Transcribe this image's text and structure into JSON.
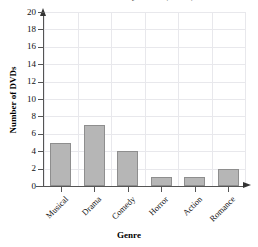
{
  "chart_data": {
    "type": "bar",
    "title": "DVD Collection by Genre (DVDs)",
    "title_cropped": true,
    "categories": [
      "Musical",
      "Drama",
      "Comedy",
      "Horror",
      "Action",
      "Romance"
    ],
    "values": [
      5,
      7,
      4,
      1,
      1,
      2
    ],
    "xlabel": "Genre",
    "ylabel": "Number of DVDs",
    "ylim": [
      0,
      20
    ],
    "ytick_step": 2,
    "yticks": [
      0,
      2,
      4,
      6,
      8,
      10,
      12,
      14,
      16,
      18,
      20
    ],
    "ytick_labels": [
      "0",
      "2",
      "4",
      "6",
      "8",
      "10",
      "12",
      "14",
      "16",
      "18",
      "20"
    ],
    "grid": true,
    "legend": false,
    "xlabel_rotation": -45,
    "bar_color": "#b6b6b6",
    "bar_border_color": "#8e8e8e",
    "grid_color": "#e8e8ec",
    "axis_color": "#555555"
  }
}
